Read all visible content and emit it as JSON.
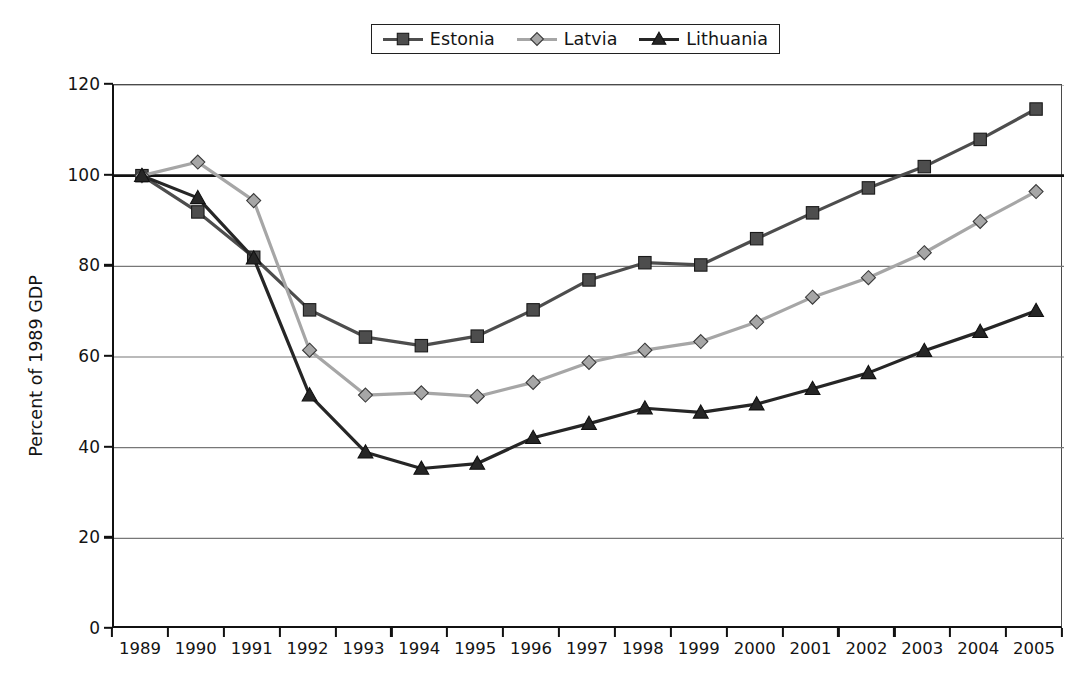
{
  "chart_data": {
    "type": "line",
    "title": "",
    "xlabel": "",
    "ylabel": "Percent of 1989 GDP",
    "categories": [
      "1989",
      "1990",
      "1991",
      "1992",
      "1993",
      "1994",
      "1995",
      "1996",
      "1997",
      "1998",
      "1999",
      "2000",
      "2001",
      "2002",
      "2003",
      "2004",
      "2005"
    ],
    "x": [
      1989,
      1990,
      1991,
      1992,
      1993,
      1994,
      1995,
      1996,
      1997,
      1998,
      1999,
      2000,
      2001,
      2002,
      2003,
      2004,
      2005
    ],
    "ylim": [
      0,
      120
    ],
    "yticks": [
      0,
      20,
      40,
      60,
      80,
      100,
      120
    ],
    "grid": "horizontal",
    "legend_position": "top-center",
    "series": [
      {
        "name": "Estonia",
        "marker": "square",
        "color": "#4d4d4d",
        "values": [
          100.0,
          92.0,
          82.0,
          70.4,
          64.4,
          62.5,
          64.6,
          70.4,
          77.0,
          80.8,
          80.3,
          86.1,
          91.8,
          97.3,
          102.0,
          108.0,
          114.7
        ]
      },
      {
        "name": "Latvia",
        "marker": "diamond",
        "color": "#a6a6a6",
        "values": [
          100.0,
          103.0,
          94.5,
          61.5,
          51.6,
          52.1,
          51.3,
          54.4,
          58.8,
          61.5,
          63.4,
          67.7,
          73.2,
          77.5,
          83.0,
          89.9,
          96.5
        ]
      },
      {
        "name": "Lithuania",
        "marker": "triangle",
        "color": "#262626",
        "values": [
          100.0,
          95.1,
          81.8,
          51.6,
          39.0,
          35.4,
          36.5,
          42.2,
          45.3,
          48.7,
          47.8,
          49.6,
          53.0,
          56.5,
          61.4,
          65.6,
          70.2
        ]
      }
    ]
  },
  "legend": {
    "items": [
      {
        "label": "Estonia"
      },
      {
        "label": "Latvia"
      },
      {
        "label": "Lithuania"
      }
    ]
  }
}
